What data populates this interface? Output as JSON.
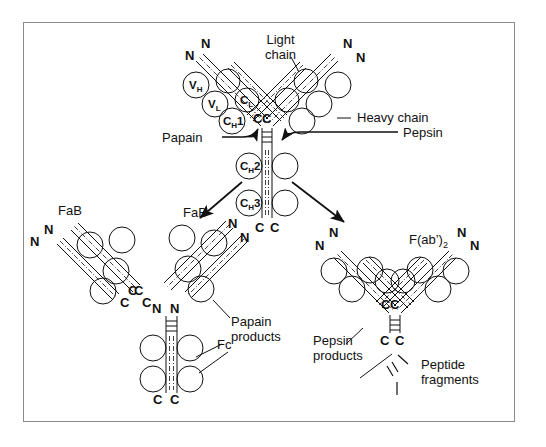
{
  "figure": {
    "border_color": "#8a8a8a",
    "ink_color": "#111111",
    "background": "#ffffff"
  },
  "annotations": {
    "light_chain": "Light\nchain",
    "light_chain_line1": "Light",
    "light_chain_line2": "chain",
    "heavy_chain": "Heavy chain",
    "papain": "Papain",
    "pepsin": "Pepsin",
    "papain_products_line1": "Papain",
    "papain_products_line2": "products",
    "pepsin_products_line1": "Pepsin",
    "pepsin_products_line2": "products",
    "peptide_fragments_line1": "Peptide",
    "peptide_fragments_line2": "fragments"
  },
  "domains": {
    "v_l": "V",
    "v_l_sub": "L",
    "v_h": "V",
    "v_h_sub": "H",
    "c_l": "C",
    "c_l_sub": "L",
    "c_h1": "C",
    "c_h1_sub": "H",
    "c_h1_num": "1",
    "c_h2": "C",
    "c_h2_sub": "H",
    "c_h2_num": "2",
    "c_h3": "C",
    "c_h3_sub": "H",
    "c_h3_num": "3"
  },
  "fragments": {
    "fab_left": "FaB",
    "fab_middle": "FaB",
    "fc": "Fc",
    "fab2": "F(ab’)",
    "fab2_sub": "2"
  },
  "termini": {
    "n": "N",
    "c": "C",
    "cc": "C C"
  },
  "terminus_labels": {
    "intact_left_outer_n": "N",
    "intact_left_inner_n": "N",
    "intact_right_inner_n": "N",
    "intact_right_outer_n": "N",
    "intact_hinge_c_left": "C",
    "intact_hinge_c_right": "C",
    "intact_tail_c_left": "C",
    "intact_tail_c_right": "C",
    "fab_left_outer_n": "N",
    "fab_left_inner_n": "N",
    "fab_left_c_upper": "C",
    "fab_left_c_lower": "C",
    "fab_mid_n_upper": "N",
    "fab_mid_n_lower": "N",
    "fab_mid_c_upper": "C",
    "fab_mid_c_lower": "C",
    "fc_n_left": "N",
    "fc_n_right": "N",
    "fc_c_left": "C",
    "fc_c_right": "C",
    "fab2_left_outer_n": "N",
    "fab2_left_inner_n": "N",
    "fab2_right_inner_n": "N",
    "fab2_right_outer_n": "N",
    "fab2_hinge_c_left": "C",
    "fab2_hinge_c_right": "C",
    "fab2_tail_c_left": "C",
    "fab2_tail_c_right": "C"
  }
}
